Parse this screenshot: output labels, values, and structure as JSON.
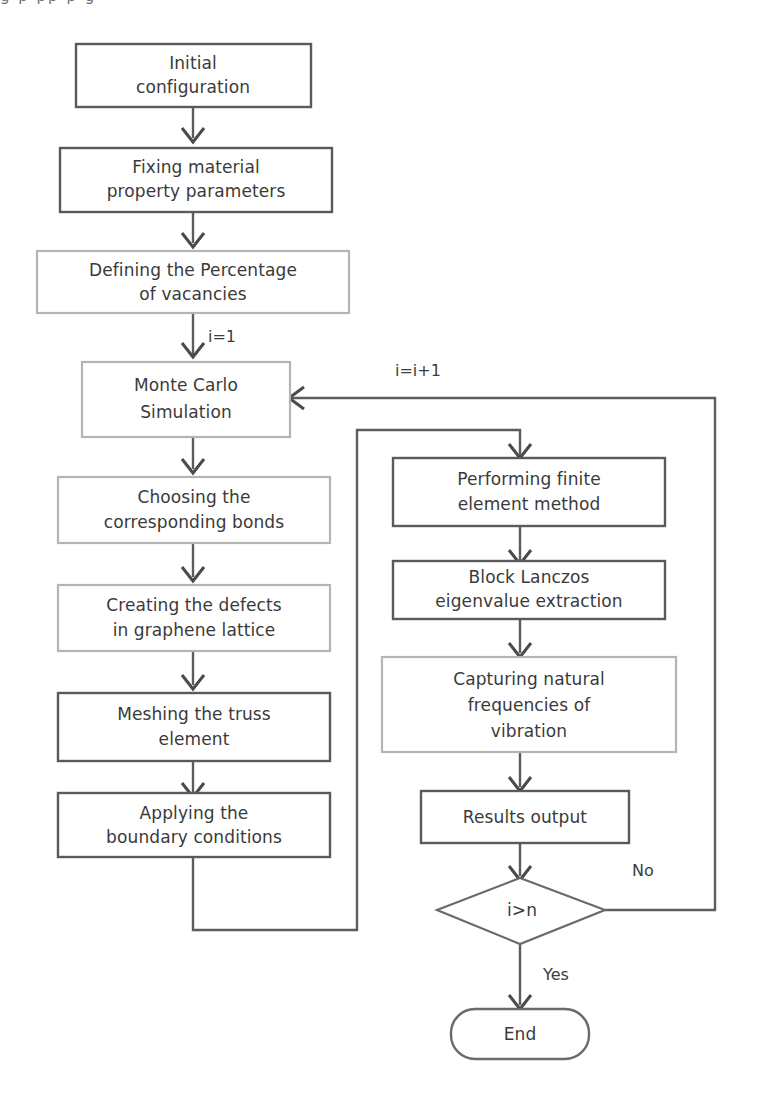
{
  "figure": {
    "type": "flowchart",
    "page_fragment_text": "g p   pp      p    g"
  },
  "colors": {
    "stroke_strong": "#5a5a5a",
    "stroke_faint": "#b4b4b4",
    "text": "#3a3a3a",
    "background": "#ffffff"
  },
  "nodes": {
    "initial_configuration": {
      "label_line1": "Initial",
      "label_line2": "configuration",
      "shape": "process",
      "border": "solid"
    },
    "fixing_material": {
      "label_line1": "Fixing material",
      "label_line2": "property parameters",
      "shape": "process",
      "border": "solid"
    },
    "defining_percentage": {
      "label_line1": "Defining the Percentage",
      "label_line2": "of vacancies",
      "shape": "process",
      "border": "faint"
    },
    "monte_carlo": {
      "label_line1": "Monte Carlo",
      "label_line2": "Simulation",
      "shape": "process",
      "border": "faint"
    },
    "choosing_bonds": {
      "label_line1": "Choosing the",
      "label_line2": "corresponding bonds",
      "shape": "process",
      "border": "faint"
    },
    "creating_defects": {
      "label_line1": "Creating the defects",
      "label_line2": "in graphene lattice",
      "shape": "process",
      "border": "faint"
    },
    "meshing_truss": {
      "label_line1": "Meshing the truss",
      "label_line2": "element",
      "shape": "process",
      "border": "solid"
    },
    "applying_bc": {
      "label_line1": "Applying the",
      "label_line2": "boundary conditions",
      "shape": "process",
      "border": "solid"
    },
    "performing_fem": {
      "label_line1": "Performing finite",
      "label_line2": "element method",
      "shape": "process",
      "border": "solid"
    },
    "block_lanczos": {
      "label_line1": "Block Lanczos",
      "label_line2": "eigenvalue extraction",
      "shape": "process",
      "border": "solid"
    },
    "capturing_frequencies": {
      "label_line1": "Capturing natural",
      "label_line2": "frequencies of",
      "label_line3": "vibration",
      "shape": "process",
      "border": "faint"
    },
    "results_output": {
      "label_line1": "Results output",
      "shape": "process",
      "border": "solid"
    },
    "decision": {
      "label_line1": "i>n",
      "shape": "decision",
      "border": "solid"
    },
    "end": {
      "label_line1": "End",
      "shape": "terminator",
      "border": "solid"
    }
  },
  "edge_labels": {
    "init_index": "i=1",
    "increment_index": "i=i+1",
    "decision_no": "No",
    "decision_yes": "Yes"
  }
}
